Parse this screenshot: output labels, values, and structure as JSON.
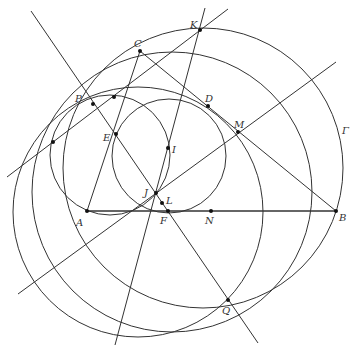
{
  "diagram": {
    "stroke_color": "#333333",
    "points": [
      {
        "id": "A",
        "label": "A",
        "x": 87,
        "y": 211,
        "lx": 76,
        "ly": 226
      },
      {
        "id": "B",
        "label": "B",
        "x": 336,
        "y": 211,
        "lx": 339,
        "ly": 221
      },
      {
        "id": "C",
        "label": "C",
        "x": 140,
        "y": 51,
        "lx": 134,
        "ly": 47
      },
      {
        "id": "D",
        "label": "D",
        "x": 208,
        "y": 106,
        "lx": 205,
        "ly": 102
      },
      {
        "id": "E",
        "label": "E",
        "x": 116,
        "y": 134,
        "lx": 103,
        "ly": 141
      },
      {
        "id": "F",
        "label": "F",
        "x": 168,
        "y": 211,
        "lx": 160,
        "ly": 224
      },
      {
        "id": "I",
        "label": "I",
        "x": 168,
        "y": 148,
        "lx": 172,
        "ly": 153
      },
      {
        "id": "J",
        "label": "J",
        "x": 156,
        "y": 193,
        "lx": 144,
        "ly": 196
      },
      {
        "id": "K",
        "label": "K",
        "x": 200,
        "y": 30,
        "lx": 190,
        "ly": 28
      },
      {
        "id": "L",
        "label": "L",
        "x": 162,
        "y": 203,
        "lx": 166,
        "ly": 204
      },
      {
        "id": "M",
        "label": "M",
        "x": 238,
        "y": 132,
        "lx": 234,
        "ly": 128
      },
      {
        "id": "N",
        "label": "N",
        "x": 211,
        "y": 211,
        "lx": 205,
        "ly": 224
      },
      {
        "id": "P",
        "label": "P",
        "x": 93,
        "y": 104,
        "lx": 75,
        "ly": 102
      },
      {
        "id": "Q",
        "label": "Q",
        "x": 228,
        "y": 300,
        "lx": 222,
        "ly": 314
      },
      {
        "id": "X1",
        "label": "",
        "x": 53,
        "y": 142,
        "lx": 0,
        "ly": 0
      },
      {
        "id": "X2",
        "label": "",
        "x": 114,
        "y": 97,
        "lx": 0,
        "ly": 0
      }
    ],
    "circle_label": {
      "label": "Γ",
      "x": 342,
      "y": 134
    },
    "circles": [
      {
        "id": "gamma",
        "cx": 203,
        "cy": 168,
        "r": 140
      },
      {
        "id": "big-left",
        "cx": 172,
        "cy": 192,
        "r": 140
      },
      {
        "id": "through-MQ",
        "cx": 138,
        "cy": 212,
        "r": 125
      },
      {
        "id": "small-left",
        "cx": 110,
        "cy": 155,
        "r": 60
      },
      {
        "id": "incircle",
        "cx": 169,
        "cy": 156,
        "r": 57
      }
    ],
    "segments": [
      {
        "id": "AB",
        "x1": 87,
        "y1": 211,
        "x2": 336,
        "y2": 211,
        "w": 1.6
      },
      {
        "id": "BC",
        "x1": 336,
        "y1": 211,
        "x2": 140,
        "y2": 51,
        "w": 1
      },
      {
        "id": "CA",
        "x1": 140,
        "y1": 51,
        "x2": 87,
        "y2": 211,
        "w": 1
      }
    ],
    "lines": [
      {
        "id": "line-PQ",
        "x1": 31,
        "y1": 11,
        "x2": 258,
        "y2": 343
      },
      {
        "id": "line-KJ",
        "x1": 205,
        "y1": 8,
        "x2": 115,
        "y2": 345
      },
      {
        "id": "line-X1K",
        "x1": 7,
        "y1": 177,
        "x2": 228,
        "y2": 9
      },
      {
        "id": "line-JM",
        "x1": 18,
        "y1": 294,
        "x2": 336,
        "y2": 62
      }
    ]
  }
}
